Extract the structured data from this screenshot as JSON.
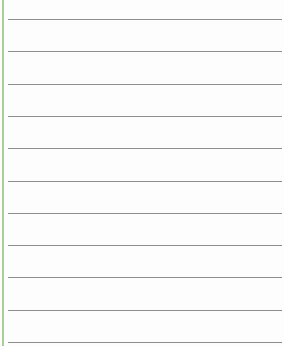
{
  "page": {
    "type": "lined-paper",
    "background_color": "#fdfdfd",
    "margin_line_color": "#a9cf95",
    "rule_color": "#8e8e8e",
    "rule_positions_px": [
      19,
      51,
      84,
      116,
      148,
      181,
      213,
      245,
      277,
      310,
      342
    ]
  }
}
